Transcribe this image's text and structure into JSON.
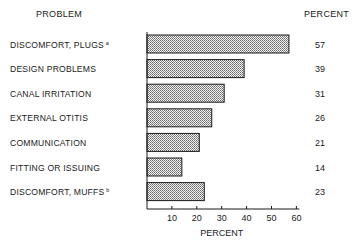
{
  "chart_data": {
    "type": "bar",
    "orientation": "horizontal",
    "title": "",
    "category_header": "PROBLEM",
    "value_header": "PERCENT",
    "xlabel": "PERCENT",
    "ylabel": "",
    "categories": [
      "DISCOMFORT, PLUGS",
      "DESIGN PROBLEMS",
      "CANAL IRRITATION",
      "EXTERNAL OTITIS",
      "COMMUNICATION",
      "FITTING OR ISSUING",
      "DISCOMFORT, MUFFS"
    ],
    "footnote_marks": [
      "a",
      "",
      "",
      "",
      "",
      "",
      "b"
    ],
    "values": [
      57,
      39,
      31,
      26,
      21,
      14,
      23
    ],
    "value_labels": [
      "57",
      "39",
      "31",
      "26",
      "21",
      "14",
      "23"
    ],
    "xlim": [
      0,
      60
    ],
    "xticks": [
      10,
      20,
      30,
      40,
      50,
      60
    ],
    "xtick_labels": [
      "10",
      "20",
      "30",
      "40",
      "50",
      "60"
    ],
    "grid": false,
    "bar_fill": "crosshatch",
    "colors": {
      "ink": "#1a1a1a",
      "bar_fill": "#d8d8d8",
      "background": "#ffffff"
    }
  }
}
